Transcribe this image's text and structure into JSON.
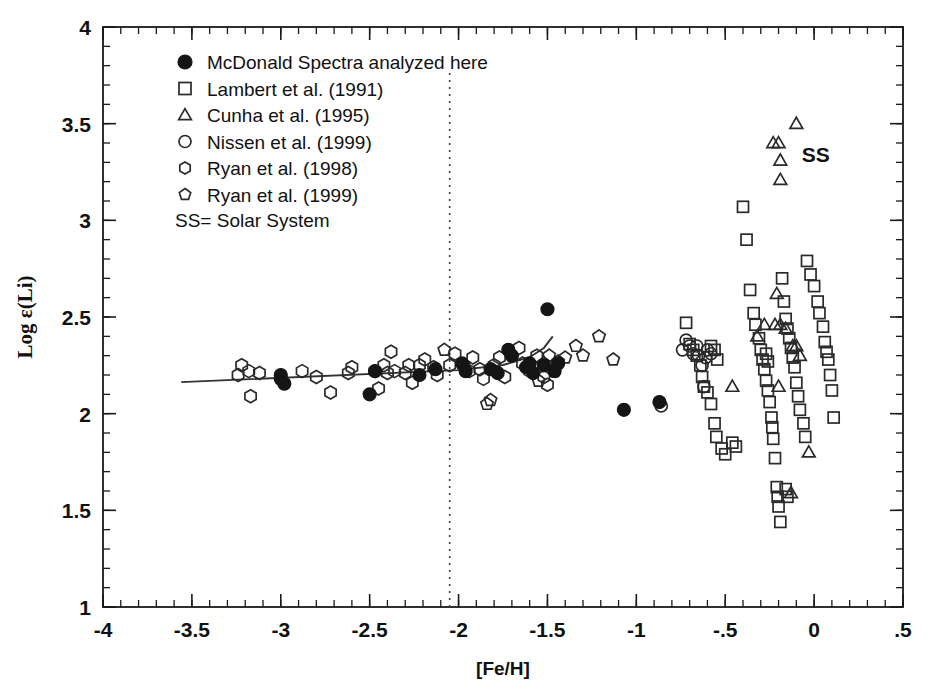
{
  "chart_data": {
    "type": "scatter",
    "title": "",
    "xlabel": "[Fe/H]",
    "ylabel": "Log ε(Li)",
    "xlim": [
      -4,
      0.5
    ],
    "ylim": [
      1,
      4
    ],
    "xticks": [
      -4,
      -3.5,
      -3,
      -2.5,
      -2,
      -1.5,
      -1,
      -0.5,
      0,
      0.5
    ],
    "xticklabels": [
      "-4",
      "-3.5",
      "-3",
      "-2.5",
      "-2",
      "-1.5",
      "-1",
      "-.5",
      "0",
      ".5"
    ],
    "yticks": [
      1,
      1.5,
      2,
      2.5,
      3,
      3.5,
      4
    ],
    "yticklabels": [
      "1",
      "1.5",
      "2",
      "2.5",
      "3",
      "3.5",
      "4"
    ],
    "x_minor_step": 0.1,
    "y_minor_step": 0.1,
    "grid": false,
    "legend_position": "upper-left",
    "annotations": [
      {
        "text": "SS",
        "x": -0.07,
        "y": 3.3,
        "name": "solar-system-label"
      }
    ],
    "reference_lines": [
      {
        "name": "metallicity-divider",
        "orientation": "vertical",
        "x": -2.05,
        "style": "dotted",
        "y_from": 1.0,
        "y_to": 3.78
      }
    ],
    "fit_line": {
      "name": "plateau-fit-line",
      "style": "solid",
      "points": [
        [
          -3.56,
          2.163
        ],
        [
          -2.0,
          2.225
        ],
        [
          -1.75,
          2.252
        ],
        [
          -1.6,
          2.292
        ],
        [
          -1.52,
          2.34
        ],
        [
          -1.47,
          2.4
        ]
      ]
    },
    "series": [
      {
        "name": "McDonald Spectra analyzed here",
        "marker": "filled-circle",
        "size": 13,
        "filled": true,
        "points": [
          [
            -3.0,
            2.18
          ],
          [
            -3.0,
            2.2
          ],
          [
            -2.98,
            2.155
          ],
          [
            -2.5,
            2.1
          ],
          [
            -2.47,
            2.22
          ],
          [
            -2.22,
            2.2
          ],
          [
            -2.13,
            2.23
          ],
          [
            -1.98,
            2.26
          ],
          [
            -1.96,
            2.22
          ],
          [
            -1.82,
            2.23
          ],
          [
            -1.78,
            2.21
          ],
          [
            -1.72,
            2.33
          ],
          [
            -1.7,
            2.3
          ],
          [
            -1.62,
            2.24
          ],
          [
            -1.6,
            2.26
          ],
          [
            -1.58,
            2.21
          ],
          [
            -1.52,
            2.25
          ],
          [
            -1.5,
            2.54
          ],
          [
            -1.46,
            2.22
          ],
          [
            -1.44,
            2.26
          ],
          [
            -1.07,
            2.02
          ],
          [
            -0.87,
            2.06
          ]
        ]
      },
      {
        "name": "Lambert et al. (1991)",
        "marker": "open-square",
        "size": 11,
        "filled": false,
        "points": [
          [
            -0.72,
            2.47
          ],
          [
            -0.7,
            2.36
          ],
          [
            -0.68,
            2.33
          ],
          [
            -0.66,
            2.3
          ],
          [
            -0.64,
            2.25
          ],
          [
            -0.63,
            2.19
          ],
          [
            -0.62,
            2.14
          ],
          [
            -0.6,
            2.11
          ],
          [
            -0.58,
            2.05
          ],
          [
            -0.56,
            1.95
          ],
          [
            -0.55,
            1.88
          ],
          [
            -0.52,
            1.82
          ],
          [
            -0.5,
            1.79
          ],
          [
            -0.46,
            1.85
          ],
          [
            -0.44,
            1.83
          ],
          [
            -0.4,
            3.07
          ],
          [
            -0.38,
            2.9
          ],
          [
            -0.36,
            2.64
          ],
          [
            -0.34,
            2.52
          ],
          [
            -0.33,
            2.46
          ],
          [
            -0.31,
            2.39
          ],
          [
            -0.3,
            2.33
          ],
          [
            -0.29,
            2.28
          ],
          [
            -0.28,
            2.23
          ],
          [
            -0.27,
            2.17
          ],
          [
            -0.26,
            2.12
          ],
          [
            -0.25,
            2.06
          ],
          [
            -0.24,
            1.98
          ],
          [
            -0.235,
            1.93
          ],
          [
            -0.23,
            1.87
          ],
          [
            -0.22,
            1.77
          ],
          [
            -0.21,
            1.62
          ],
          [
            -0.205,
            1.57
          ],
          [
            -0.2,
            1.52
          ],
          [
            -0.19,
            1.44
          ],
          [
            -0.18,
            2.7
          ],
          [
            -0.17,
            2.58
          ],
          [
            -0.16,
            2.49
          ],
          [
            -0.15,
            2.44
          ],
          [
            -0.14,
            2.39
          ],
          [
            -0.13,
            2.34
          ],
          [
            -0.12,
            2.29
          ],
          [
            -0.11,
            2.24
          ],
          [
            -0.1,
            2.16
          ],
          [
            -0.09,
            2.09
          ],
          [
            -0.08,
            2.02
          ],
          [
            -0.06,
            1.95
          ],
          [
            -0.05,
            1.88
          ],
          [
            -0.04,
            2.79
          ],
          [
            -0.02,
            2.72
          ],
          [
            0.0,
            2.66
          ],
          [
            0.02,
            2.58
          ],
          [
            0.03,
            2.52
          ],
          [
            0.05,
            2.45
          ],
          [
            0.06,
            2.37
          ],
          [
            0.07,
            2.32
          ],
          [
            0.08,
            2.28
          ],
          [
            0.09,
            2.2
          ],
          [
            0.1,
            2.12
          ],
          [
            0.11,
            1.98
          ],
          [
            -0.27,
            2.31
          ],
          [
            -0.26,
            2.27
          ],
          [
            -0.16,
            1.61
          ],
          [
            -0.15,
            1.57
          ],
          [
            -0.58,
            2.35
          ],
          [
            -0.56,
            2.33
          ],
          [
            -0.545,
            2.28
          ]
        ]
      },
      {
        "name": "Cunha et al. (1995)",
        "marker": "open-triangle",
        "size": 12,
        "filled": false,
        "points": [
          [
            -0.1,
            3.5
          ],
          [
            -0.23,
            3.4
          ],
          [
            -0.2,
            3.4
          ],
          [
            -0.19,
            3.31
          ],
          [
            -0.19,
            3.21
          ],
          [
            -0.21,
            2.62
          ],
          [
            -0.28,
            2.46
          ],
          [
            -0.22,
            2.46
          ],
          [
            -0.19,
            2.46
          ],
          [
            -0.32,
            2.4
          ],
          [
            -0.16,
            2.44
          ],
          [
            -0.12,
            2.35
          ],
          [
            -0.1,
            2.35
          ],
          [
            -0.08,
            2.3
          ],
          [
            -0.46,
            2.14
          ],
          [
            -0.2,
            2.14
          ],
          [
            -0.03,
            1.8
          ],
          [
            -0.13,
            1.59
          ]
        ]
      },
      {
        "name": "Nissen et al. (1999)",
        "marker": "open-circle",
        "size": 12,
        "filled": false,
        "points": [
          [
            -0.74,
            2.33
          ],
          [
            -0.72,
            2.38
          ],
          [
            -0.7,
            2.35
          ],
          [
            -0.68,
            2.31
          ],
          [
            -0.66,
            2.35
          ],
          [
            -0.65,
            2.3
          ],
          [
            -0.63,
            2.25
          ],
          [
            -0.61,
            2.29
          ],
          [
            -0.6,
            2.33
          ],
          [
            -0.58,
            2.31
          ],
          [
            -0.86,
            2.04
          ],
          [
            -0.62,
            2.14
          ]
        ]
      },
      {
        "name": "Ryan et al. (1998)",
        "marker": "open-hexagon",
        "size": 13,
        "filled": false,
        "points": [
          [
            -3.24,
            2.2
          ],
          [
            -3.22,
            2.25
          ],
          [
            -3.18,
            2.22
          ],
          [
            -3.17,
            2.09
          ],
          [
            -3.12,
            2.21
          ],
          [
            -2.88,
            2.22
          ],
          [
            -2.8,
            2.19
          ],
          [
            -2.72,
            2.11
          ],
          [
            -2.62,
            2.21
          ],
          [
            -2.6,
            2.24
          ],
          [
            -2.47,
            2.22
          ],
          [
            -2.42,
            2.25
          ],
          [
            -2.4,
            2.21
          ],
          [
            -2.38,
            2.32
          ],
          [
            -2.36,
            2.22
          ],
          [
            -2.3,
            2.21
          ],
          [
            -2.28,
            2.25
          ],
          [
            -2.26,
            2.16
          ],
          [
            -2.22,
            2.25
          ],
          [
            -2.19,
            2.28
          ],
          [
            -2.14,
            2.24
          ],
          [
            -2.12,
            2.2
          ],
          [
            -2.05,
            2.25
          ],
          [
            -2.02,
            2.31
          ],
          [
            -1.97,
            2.25
          ],
          [
            -1.94,
            2.22
          ],
          [
            -1.92,
            2.29
          ],
          [
            -1.88,
            2.23
          ],
          [
            -1.86,
            2.18
          ],
          [
            -1.8,
            2.25
          ],
          [
            -1.77,
            2.29
          ],
          [
            -1.66,
            2.34
          ],
          [
            -1.64,
            2.26
          ],
          [
            -1.6,
            2.22
          ],
          [
            -1.56,
            2.3
          ],
          [
            -1.52,
            2.19
          ],
          [
            -1.5,
            2.15
          ],
          [
            -1.74,
            2.19
          ],
          [
            -2.45,
            2.13
          ]
        ]
      },
      {
        "name": "Ryan et al. (1999)",
        "marker": "open-pentagon",
        "size": 13,
        "filled": false,
        "points": [
          [
            -2.08,
            2.33
          ],
          [
            -1.84,
            2.05
          ],
          [
            -1.82,
            2.07
          ],
          [
            -1.52,
            2.26
          ],
          [
            -1.49,
            2.3
          ],
          [
            -1.46,
            2.22
          ],
          [
            -1.44,
            2.27
          ],
          [
            -1.4,
            2.29
          ],
          [
            -1.34,
            2.35
          ],
          [
            -1.3,
            2.3
          ],
          [
            -1.21,
            2.4
          ],
          [
            -1.13,
            2.28
          ],
          [
            -1.55,
            2.17
          ]
        ]
      }
    ]
  },
  "legend": {
    "name": "plot-legend",
    "entries": [
      {
        "marker": "filled-circle",
        "label": "McDonald Spectra analyzed here"
      },
      {
        "marker": "open-square",
        "label": "Lambert et al. (1991)"
      },
      {
        "marker": "open-triangle",
        "label": "Cunha et al. (1995)"
      },
      {
        "marker": "open-circle",
        "label": "Nissen et al. (1999)"
      },
      {
        "marker": "open-hexagon",
        "label": "Ryan et al. (1998)"
      },
      {
        "marker": "open-pentagon",
        "label": "Ryan et al. (1999)"
      }
    ],
    "note": "SS= Solar System"
  },
  "colors": {
    "marker_stroke": "#2a2a2a",
    "marker_fill": "#151515",
    "axis": "#1a1a1a",
    "background": "#ffffff"
  }
}
